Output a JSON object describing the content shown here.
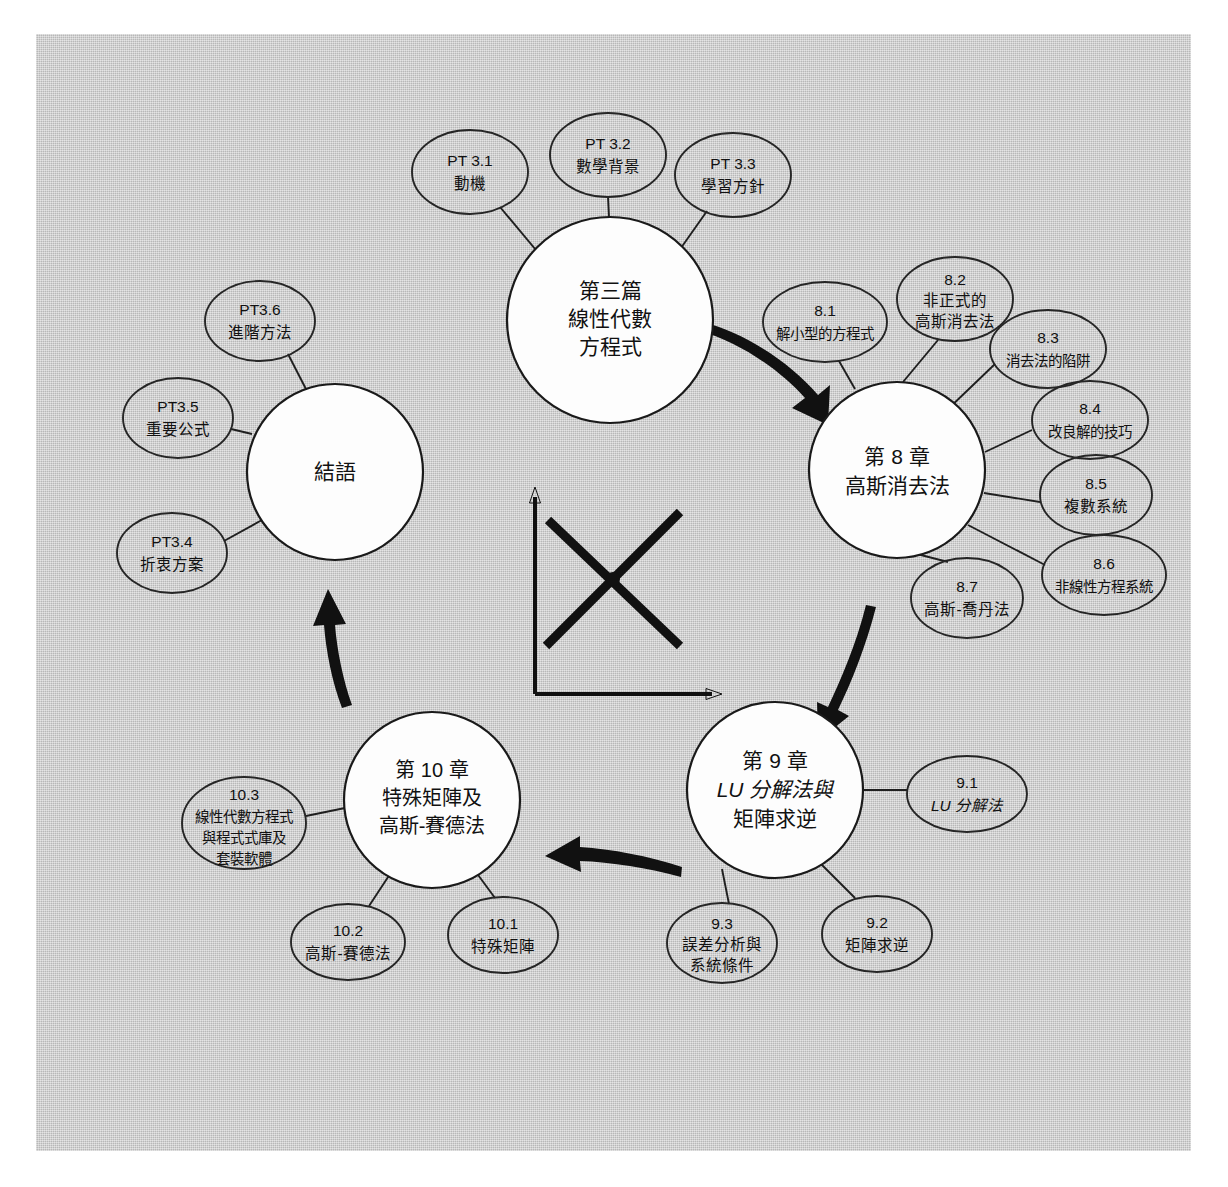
{
  "figure": {
    "kind": "mind-map-diagram",
    "background_color": "#c9c9c9",
    "page_color": "#ffffff",
    "ink_color": "#111111",
    "node_fill": "#fdfdfd"
  },
  "center_icon": {
    "name": "crossing-lines-graph-icon",
    "description": "two crossing thick lines over an x-y axis"
  },
  "main_nodes": {
    "part3": {
      "id": "part3",
      "lines": [
        "第三篇",
        "線性代數",
        "方程式"
      ],
      "cx": 610,
      "cy": 320,
      "r": 103
    },
    "chapter8": {
      "id": "chapter8",
      "lines": [
        "第 8 章",
        "高斯消去法"
      ],
      "cx": 897,
      "cy": 470,
      "r": 88
    },
    "chapter9": {
      "id": "chapter9",
      "lines": [
        "第 9 章",
        "LU 分解法與",
        "矩陣求逆"
      ],
      "italic_lines": [
        1
      ],
      "cx": 775,
      "cy": 790,
      "r": 88
    },
    "chapter10": {
      "id": "chapter10",
      "lines": [
        "第 10 章",
        "特殊矩陣及",
        "高斯-賽德法"
      ],
      "cx": 432,
      "cy": 800,
      "r": 88
    },
    "epilogue": {
      "id": "epilogue",
      "lines": [
        "結語"
      ],
      "cx": 335,
      "cy": 472,
      "r": 88
    }
  },
  "sub_nodes": [
    {
      "id": "pt3-1",
      "parent": "part3",
      "lines": [
        "PT 3.1",
        "動機"
      ],
      "cx": 470,
      "cy": 172,
      "rx": 58,
      "ry": 42
    },
    {
      "id": "pt3-2",
      "parent": "part3",
      "lines": [
        "PT 3.2",
        "數學背景"
      ],
      "cx": 608,
      "cy": 155,
      "rx": 58,
      "ry": 42
    },
    {
      "id": "pt3-3",
      "parent": "part3",
      "lines": [
        "PT 3.3",
        "學習方針"
      ],
      "cx": 733,
      "cy": 175,
      "rx": 58,
      "ry": 42
    },
    {
      "id": "pt3-6",
      "parent": "epilogue",
      "lines": [
        "PT3.6",
        "進階方法"
      ],
      "cx": 260,
      "cy": 321,
      "rx": 55,
      "ry": 40
    },
    {
      "id": "pt3-5",
      "parent": "epilogue",
      "lines": [
        "PT3.5",
        "重要公式"
      ],
      "cx": 178,
      "cy": 418,
      "rx": 55,
      "ry": 40
    },
    {
      "id": "pt3-4",
      "parent": "epilogue",
      "lines": [
        "PT3.4",
        "折衷方案"
      ],
      "cx": 172,
      "cy": 553,
      "rx": 55,
      "ry": 40
    },
    {
      "id": "s8-1",
      "parent": "chapter8",
      "lines": [
        "8.1",
        "解小型的方程式"
      ],
      "cx": 825,
      "cy": 322,
      "rx": 62,
      "ry": 40
    },
    {
      "id": "s8-2",
      "parent": "chapter8",
      "lines": [
        "8.2",
        "非正式的",
        "高斯消去法"
      ],
      "cx": 955,
      "cy": 299,
      "rx": 58,
      "ry": 42
    },
    {
      "id": "s8-3",
      "parent": "chapter8",
      "lines": [
        "8.3",
        "消去法的陷阱"
      ],
      "cx": 1048,
      "cy": 349,
      "rx": 58,
      "ry": 39
    },
    {
      "id": "s8-4",
      "parent": "chapter8",
      "lines": [
        "8.4",
        "改良解的技巧"
      ],
      "cx": 1090,
      "cy": 420,
      "rx": 58,
      "ry": 39
    },
    {
      "id": "s8-5",
      "parent": "chapter8",
      "lines": [
        "8.5",
        "複數系統"
      ],
      "cx": 1096,
      "cy": 495,
      "rx": 56,
      "ry": 40
    },
    {
      "id": "s8-6",
      "parent": "chapter8",
      "lines": [
        "8.6",
        "非線性方程系統"
      ],
      "cx": 1104,
      "cy": 575,
      "rx": 62,
      "ry": 40
    },
    {
      "id": "s8-7",
      "parent": "chapter8",
      "lines": [
        "8.7",
        "高斯-喬丹法"
      ],
      "cx": 967,
      "cy": 598,
      "rx": 56,
      "ry": 40
    },
    {
      "id": "s9-1",
      "parent": "chapter9",
      "lines": [
        "9.1",
        "LU 分解法"
      ],
      "italic_lines": [
        1
      ],
      "cx": 967,
      "cy": 794,
      "rx": 60,
      "ry": 38
    },
    {
      "id": "s9-2",
      "parent": "chapter9",
      "lines": [
        "9.2",
        "矩陣求逆"
      ],
      "cx": 877,
      "cy": 934,
      "rx": 55,
      "ry": 38
    },
    {
      "id": "s9-3",
      "parent": "chapter9",
      "lines": [
        "9.3",
        "誤差分析與",
        "系統條件"
      ],
      "cx": 722,
      "cy": 943,
      "rx": 55,
      "ry": 40
    },
    {
      "id": "s10-1",
      "parent": "chapter10",
      "lines": [
        "10.1",
        "特殊矩陣"
      ],
      "cx": 503,
      "cy": 935,
      "rx": 55,
      "ry": 38
    },
    {
      "id": "s10-2",
      "parent": "chapter10",
      "lines": [
        "10.2",
        "高斯-賽德法"
      ],
      "cx": 348,
      "cy": 942,
      "rx": 57,
      "ry": 38
    },
    {
      "id": "s10-3",
      "parent": "chapter10",
      "lines": [
        "10.3",
        "線性代數方程式",
        "與程式式庫及",
        "套裝軟體"
      ],
      "cx": 244,
      "cy": 823,
      "rx": 62,
      "ry": 46
    }
  ],
  "flow_arrows": [
    {
      "id": "arrow-part3-to-ch8",
      "from": "part3",
      "to": "chapter8"
    },
    {
      "id": "arrow-ch8-to-ch9",
      "from": "chapter8",
      "to": "chapter9"
    },
    {
      "id": "arrow-ch9-to-ch10",
      "from": "chapter9",
      "to": "chapter10"
    },
    {
      "id": "arrow-ch10-to-epilogue",
      "from": "chapter10",
      "to": "epilogue"
    }
  ]
}
